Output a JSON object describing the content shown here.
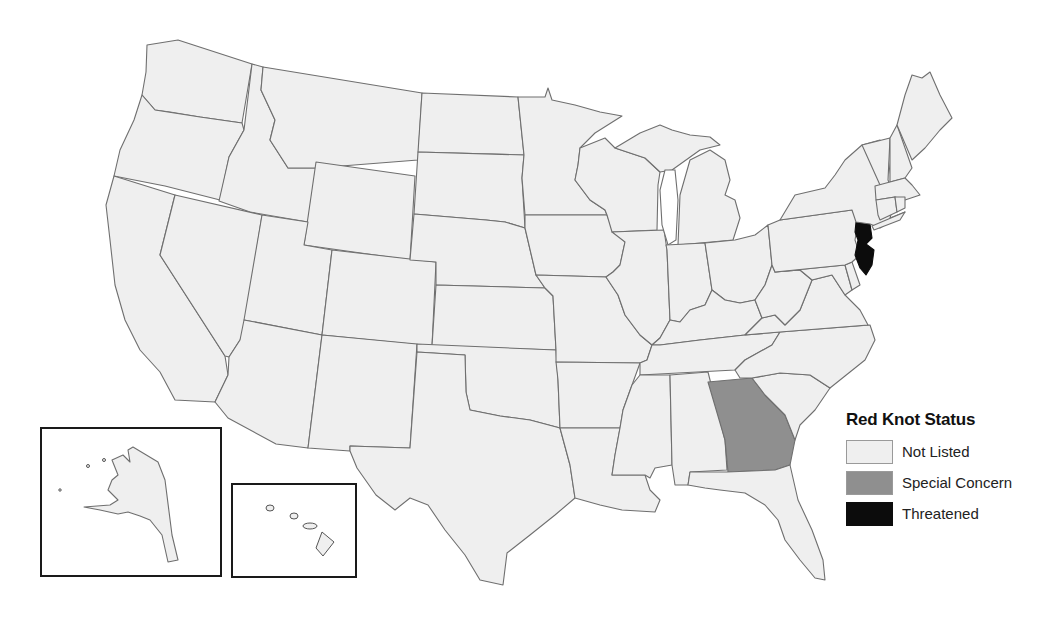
{
  "map": {
    "title": "Red Knot Status",
    "region": "United States",
    "colors": {
      "not_listed": "#efefef",
      "special_concern": "#8f8f8f",
      "threatened": "#0c0c0c",
      "border": "#6f6f6f"
    },
    "states_by_status": {
      "threatened": [
        "New Jersey"
      ],
      "special_concern": [
        "Georgia"
      ],
      "not_listed": "all other states"
    },
    "insets": [
      "Alaska",
      "Hawaii"
    ]
  },
  "legend": {
    "title": "Red Knot Status",
    "items": [
      {
        "label": "Not Listed",
        "color": "#efefef"
      },
      {
        "label": "Special Concern",
        "color": "#8f8f8f"
      },
      {
        "label": "Threatened",
        "color": "#0c0c0c"
      }
    ]
  }
}
